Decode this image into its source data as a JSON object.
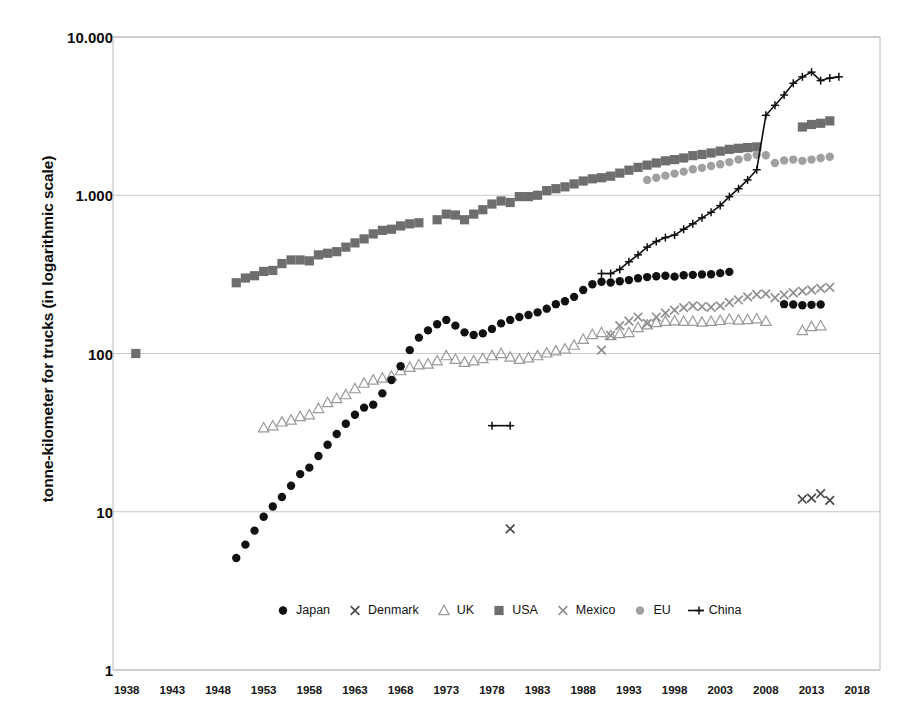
{
  "chart_data": {
    "type": "scatter",
    "title": "",
    "subtitle": "",
    "xlabel": "",
    "ylabel": "tonne-kilometer for trucks (in logarithmic scale)",
    "yscale": "log",
    "ylim": [
      1,
      10000
    ],
    "xlim": [
      1936.5,
      2020.5
    ],
    "grid": true,
    "legend_position": "bottom",
    "ytick_labels": [
      "10.000",
      "1.000",
      "100",
      "10",
      "1"
    ],
    "ytick_values": [
      10000,
      1000,
      100,
      10,
      1
    ],
    "xtick_labels": [
      "1938",
      "1943",
      "1948",
      "1953",
      "1958",
      "1963",
      "1968",
      "1973",
      "1978",
      "1983",
      "1988",
      "1993",
      "1998",
      "2003",
      "2008",
      "2013",
      "2018"
    ],
    "xtick_values": [
      1938,
      1943,
      1948,
      1953,
      1958,
      1963,
      1968,
      1973,
      1978,
      1983,
      1988,
      1993,
      1998,
      2003,
      2008,
      2013,
      2018
    ],
    "series": [
      {
        "name": "Japan",
        "marker": "filled-circle",
        "color": "#111111",
        "x": [
          1950,
          1951,
          1952,
          1953,
          1954,
          1955,
          1956,
          1957,
          1958,
          1959,
          1960,
          1961,
          1962,
          1963,
          1964,
          1965,
          1966,
          1967,
          1968,
          1969,
          1970,
          1971,
          1972,
          1973,
          1974,
          1975,
          1976,
          1977,
          1978,
          1979,
          1980,
          1981,
          1982,
          1983,
          1984,
          1985,
          1986,
          1987,
          1988,
          1989,
          1990,
          1991,
          1992,
          1993,
          1994,
          1995,
          1996,
          1997,
          1998,
          1999,
          2000,
          2001,
          2002,
          2003,
          2004,
          2010,
          2011,
          2012,
          2013,
          2014
        ],
        "y": [
          5.1,
          6.2,
          7.6,
          9.3,
          10.8,
          12.4,
          14.6,
          17.3,
          19.0,
          22.5,
          26.5,
          31.0,
          36.0,
          41.0,
          45.5,
          47.5,
          56.0,
          68.0,
          83.0,
          105.0,
          126.0,
          140.0,
          153.0,
          163.0,
          150.0,
          136.0,
          131.0,
          134.0,
          143.0,
          155.0,
          163.0,
          170.0,
          175.0,
          182.0,
          192.0,
          205.0,
          214.0,
          228.0,
          252.0,
          274.0,
          284.0,
          281.0,
          286.0,
          291.0,
          299.0,
          304.0,
          308.0,
          310.0,
          306.0,
          312.0,
          314.0,
          316.0,
          317.0,
          322.0,
          328.0,
          205.0,
          204.0,
          202.0,
          203.0,
          204.0
        ]
      },
      {
        "name": "Denmark",
        "marker": "x-cross",
        "color": "#4a4a4a",
        "x": [
          1980,
          2012,
          2013,
          2014,
          2015
        ],
        "y": [
          7.8,
          12.0,
          12.2,
          13.0,
          11.8
        ]
      },
      {
        "name": "UK",
        "marker": "open-triangle",
        "color": "#9a9a9a",
        "x": [
          1953,
          1954,
          1955,
          1956,
          1957,
          1958,
          1959,
          1960,
          1961,
          1962,
          1963,
          1964,
          1965,
          1966,
          1967,
          1968,
          1969,
          1970,
          1971,
          1972,
          1973,
          1974,
          1975,
          1976,
          1977,
          1978,
          1979,
          1980,
          1981,
          1982,
          1983,
          1984,
          1985,
          1986,
          1987,
          1988,
          1989,
          1990,
          1991,
          1992,
          1993,
          1994,
          1995,
          1996,
          1997,
          1998,
          1999,
          2000,
          2001,
          2002,
          2003,
          2004,
          2005,
          2006,
          2007,
          2008,
          2012,
          2013,
          2014
        ],
        "y": [
          34.0,
          35.0,
          37.0,
          38.0,
          40.0,
          41.0,
          45.0,
          49.0,
          52.0,
          55.0,
          60.0,
          65.0,
          68.0,
          70.0,
          72.0,
          78.0,
          82.0,
          85.0,
          86.0,
          90.0,
          97.0,
          92.0,
          88.0,
          90.0,
          93.0,
          97.0,
          100.0,
          95.0,
          92.0,
          94.0,
          97.0,
          101.0,
          104.0,
          107.0,
          113.0,
          123.0,
          132.0,
          136.0,
          130.0,
          134.0,
          136.0,
          146.0,
          152.0,
          157.0,
          160.0,
          161.0,
          160.0,
          160.0,
          158.0,
          160.0,
          162.0,
          165.0,
          163.0,
          164.0,
          166.0,
          160.0,
          140.0,
          148.0,
          150.0
        ]
      },
      {
        "name": "USA",
        "marker": "filled-square",
        "color": "#6e6e6e",
        "x": [
          1939,
          1950,
          1951,
          1952,
          1953,
          1954,
          1955,
          1956,
          1957,
          1958,
          1959,
          1960,
          1961,
          1962,
          1963,
          1964,
          1965,
          1966,
          1967,
          1968,
          1969,
          1970,
          1972,
          1973,
          1974,
          1975,
          1976,
          1977,
          1978,
          1979,
          1980,
          1981,
          1982,
          1983,
          1984,
          1985,
          1986,
          1987,
          1988,
          1989,
          1990,
          1991,
          1992,
          1993,
          1994,
          1995,
          1996,
          1997,
          1998,
          1999,
          2000,
          2001,
          2002,
          2003,
          2004,
          2005,
          2006,
          2007,
          2012,
          2013,
          2014,
          2015
        ],
        "y": [
          100.0,
          280.0,
          300.0,
          310.0,
          330.0,
          335.0,
          370.0,
          390.0,
          390.0,
          385.0,
          420.0,
          430.0,
          440.0,
          470.0,
          500.0,
          530.0,
          570.0,
          600.0,
          610.0,
          640.0,
          660.0,
          670.0,
          700.0,
          760.0,
          750.0,
          700.0,
          760.0,
          810.0,
          880.0,
          920.0,
          900.0,
          980.0,
          980.0,
          1000.0,
          1070.0,
          1100.0,
          1130.0,
          1180.0,
          1230.0,
          1270.0,
          1290.0,
          1320.0,
          1380.0,
          1440.0,
          1500.0,
          1550.0,
          1600.0,
          1650.0,
          1680.0,
          1720.0,
          1780.0,
          1810.0,
          1850.0,
          1900.0,
          1950.0,
          1980.0,
          2000.0,
          2020.0,
          2700.0,
          2800.0,
          2850.0,
          2950.0
        ]
      },
      {
        "name": "Mexico",
        "marker": "x-cross",
        "color": "#8f8f8f",
        "x": [
          1990,
          1991,
          1992,
          1993,
          1994,
          1995,
          1996,
          1997,
          1998,
          1999,
          2000,
          2001,
          2002,
          2003,
          2004,
          2005,
          2006,
          2007,
          2008,
          2009,
          2010,
          2011,
          2012,
          2013,
          2014,
          2015
        ],
        "y": [
          105.0,
          130.0,
          150.0,
          160.0,
          170.0,
          155.0,
          170.0,
          180.0,
          188.0,
          195.0,
          200.0,
          198.0,
          196.0,
          200.0,
          210.0,
          218.0,
          228.0,
          236.0,
          238.0,
          225.0,
          235.0,
          242.0,
          248.0,
          252.0,
          258.0,
          262.0
        ]
      },
      {
        "name": "EU",
        "marker": "filled-circle",
        "color": "#a0a0a0",
        "x": [
          1995,
          1996,
          1997,
          1998,
          1999,
          2000,
          2001,
          2002,
          2003,
          2004,
          2005,
          2006,
          2007,
          2008,
          2009,
          2010,
          2011,
          2012,
          2013,
          2014,
          2015
        ],
        "y": [
          1250.0,
          1290.0,
          1330.0,
          1370.0,
          1410.0,
          1460.0,
          1490.0,
          1530.0,
          1570.0,
          1620.0,
          1680.0,
          1740.0,
          1800.0,
          1790.0,
          1600.0,
          1660.0,
          1680.0,
          1650.0,
          1680.0,
          1720.0,
          1750.0
        ]
      },
      {
        "name": "China",
        "marker": "line-plus",
        "color": "#0f0f0f",
        "x": [
          1978,
          1980,
          1990,
          1991,
          1992,
          1993,
          1994,
          1995,
          1996,
          1997,
          1998,
          1999,
          2000,
          2001,
          2002,
          2003,
          2004,
          2005,
          2006,
          2007,
          2008,
          2009,
          2010,
          2011,
          2012,
          2013,
          2014,
          2015,
          2016
        ],
        "y": [
          35.0,
          35.0,
          320.0,
          320.0,
          340.0,
          380.0,
          420.0,
          470.0,
          510.0,
          540.0,
          560.0,
          610.0,
          660.0,
          720.0,
          780.0,
          860.0,
          980.0,
          1100.0,
          1250.0,
          1450.0,
          3200.0,
          3700.0,
          4300.0,
          5100.0,
          5600.0,
          6000.0,
          5300.0,
          5500.0,
          5600.0
        ]
      }
    ]
  },
  "legend": {
    "items": [
      {
        "label": "Japan",
        "marker": "filled-circle",
        "color": "#111111"
      },
      {
        "label": "Denmark",
        "marker": "x-cross",
        "color": "#4a4a4a"
      },
      {
        "label": "UK",
        "marker": "open-triangle",
        "color": "#9a9a9a"
      },
      {
        "label": "USA",
        "marker": "filled-square",
        "color": "#6e6e6e"
      },
      {
        "label": "Mexico",
        "marker": "x-cross",
        "color": "#8f8f8f"
      },
      {
        "label": "EU",
        "marker": "filled-circle",
        "color": "#a0a0a0"
      },
      {
        "label": "China",
        "marker": "line-plus",
        "color": "#0f0f0f"
      }
    ]
  },
  "axes": {
    "plot_left": 113,
    "plot_right": 880,
    "plot_top": 37,
    "plot_bottom": 670,
    "gridline_color": "#c9c9c9",
    "frame_color": "#b8b8b8"
  }
}
